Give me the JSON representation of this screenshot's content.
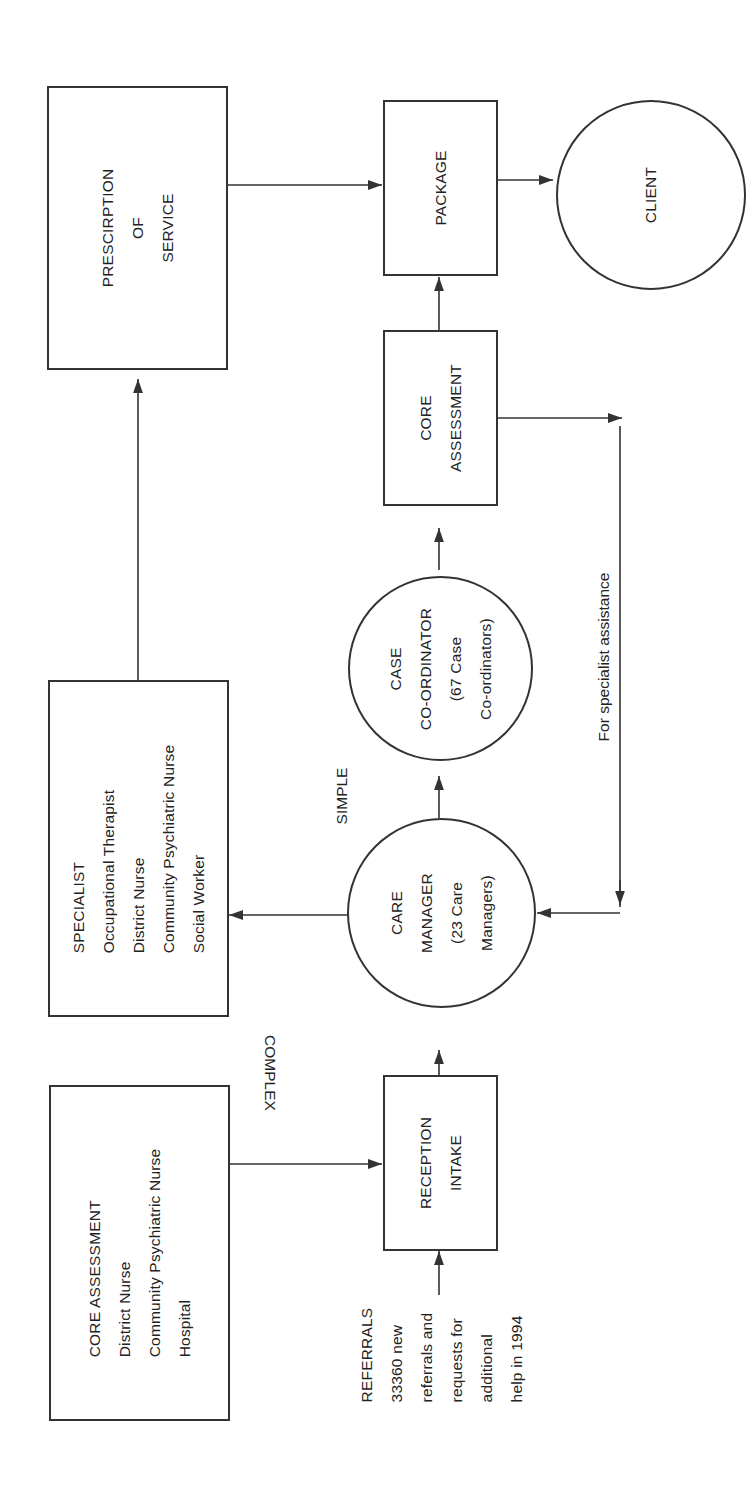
{
  "diagram": {
    "type": "flowchart",
    "orientation": "rotated-90-counterclockwise",
    "line_color": "#333333",
    "background": "#ffffff"
  },
  "nodes": {
    "prescription": {
      "lines": [
        "PRESCIRPTION",
        "OF",
        "SERVICE"
      ]
    },
    "package": {
      "lines": [
        "PACKAGE"
      ]
    },
    "client": {
      "lines": [
        "CLIENT"
      ]
    },
    "core_assessment_small": {
      "lines": [
        "CORE",
        "ASSESSMENT"
      ]
    },
    "case_coordinator": {
      "lines": [
        "CASE",
        "CO-ORDINATOR",
        "(67 Case",
        "Co-ordinators)"
      ]
    },
    "care_manager": {
      "lines": [
        "CARE",
        "MANAGER",
        "(23 Care",
        "Managers)"
      ]
    },
    "specialist": {
      "lines": [
        "SPECIALIST",
        "Occupational Therapist",
        "District Nurse",
        "Community Psychiatric Nurse",
        "Social Worker"
      ]
    },
    "core_assessment_large": {
      "lines": [
        "CORE ASSESSMENT",
        "District Nurse",
        "Community Psychiatric Nurse",
        "Hospital"
      ]
    },
    "reception_intake": {
      "lines": [
        "RECEPTION",
        "INTAKE"
      ]
    },
    "referrals": {
      "lines": [
        "REFERRALS",
        "33360 new",
        "referrals and",
        "requests for",
        "additional",
        "help in 1994"
      ]
    }
  },
  "edge_labels": {
    "simple": "SIMPLE",
    "complex": "COMPLEX",
    "specialist_assistance": "For specialist assistance"
  },
  "edges": [
    {
      "from": "Referrals",
      "to": "Reception Intake"
    },
    {
      "from": "Core Assessment (District Nurse, CPN, Hospital)",
      "to": "Reception Intake"
    },
    {
      "from": "Reception Intake",
      "to": "Care Manager"
    },
    {
      "from": "Care Manager",
      "to": "Specialist",
      "label": "COMPLEX"
    },
    {
      "from": "Care Manager",
      "to": "Case Co-ordinator",
      "label": "SIMPLE"
    },
    {
      "from": "Case Co-ordinator",
      "to": "Core Assessment"
    },
    {
      "from": "Core Assessment",
      "to": "Care Manager",
      "label": "For specialist assistance"
    },
    {
      "from": "Core Assessment",
      "to": "Package"
    },
    {
      "from": "Specialist",
      "to": "Prescription of Service"
    },
    {
      "from": "Prescription of Service",
      "to": "Package"
    },
    {
      "from": "Package",
      "to": "Client"
    }
  ]
}
